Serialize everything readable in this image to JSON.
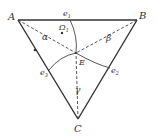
{
  "diagram": {
    "points": {
      "A": {
        "label": "A",
        "x": 18,
        "y": 20
      },
      "B": {
        "label": "B",
        "x": 137,
        "y": 20
      },
      "C": {
        "label": "C",
        "x": 78,
        "y": 119
      },
      "E": {
        "label": "E",
        "x": 76,
        "y": 53
      }
    },
    "edge_labels": {
      "e1": "e",
      "e1_sub": "1",
      "e2": "e",
      "e2_sub": "2",
      "e3": "e",
      "e3_sub": "3"
    },
    "angle_labels": {
      "alpha": "α",
      "beta": "β",
      "gamma": "γ"
    },
    "region_label": "Ω",
    "region_sub": "1",
    "colors": {
      "stroke": "#333333",
      "background": "#ffffff"
    }
  }
}
